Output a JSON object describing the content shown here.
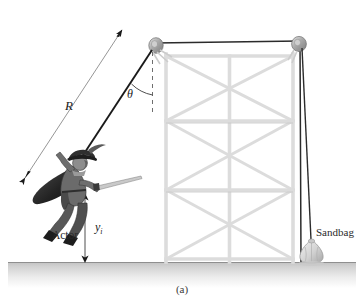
{
  "figure": {
    "caption": "(a)",
    "labels": {
      "rope_length": "R",
      "angle": "θ",
      "height": "y",
      "height_subscript": "i",
      "actor": "Actor",
      "sandbag": "Sandbag"
    },
    "colors": {
      "line_dark": "#1a1a1a",
      "line_gray": "#9a9a9a",
      "truss": "#d8d8d8",
      "truss_edge": "#b5b5b5",
      "pulley": "#a8a8a8",
      "ground_top": "#cfcfcf",
      "ground_bottom": "#ffffff",
      "actor_dark": "#2b2b2b",
      "actor_mid": "#6e6e6e",
      "actor_light": "#b9b9b9",
      "sandbag": "#dcdcdc",
      "text": "#1b1b1b"
    },
    "geometry": {
      "pivot_x": 155,
      "pivot_y": 42,
      "actor_x": 62,
      "actor_y": 178,
      "ground_y": 262,
      "tower_left_x": 162,
      "tower_right_x": 297,
      "tower_top_y": 44,
      "sandbag_x": 313,
      "sandbag_y": 250
    }
  }
}
